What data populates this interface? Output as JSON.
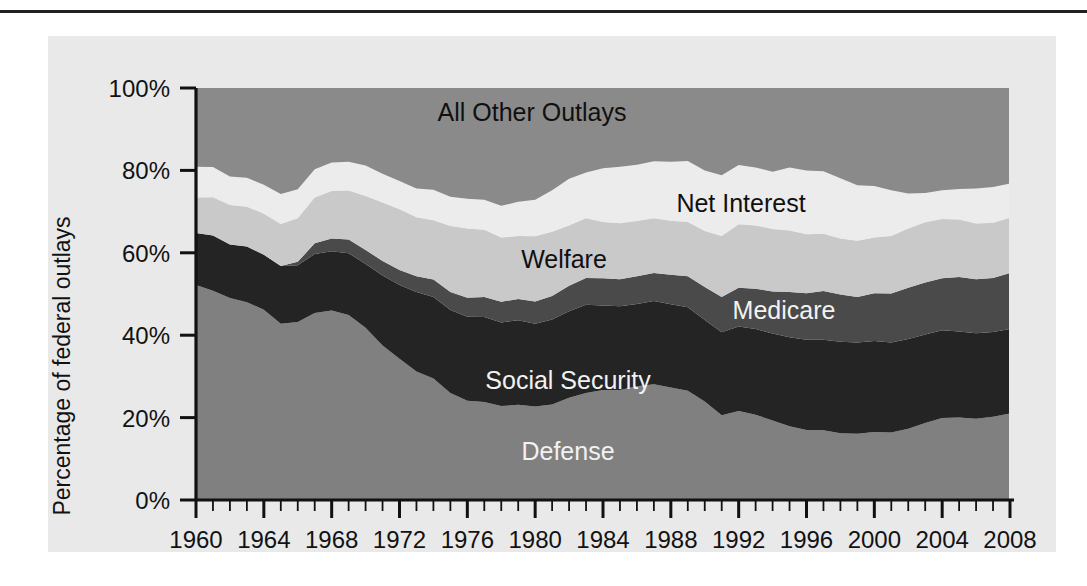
{
  "figure": {
    "panel_color": "#e9e9e9",
    "background_color": "#ffffff",
    "top_rule_color": "#222222"
  },
  "axis": {
    "y_title": "Percentage of federal outlays",
    "y_ticks": [
      "0%",
      "20%",
      "40%",
      "60%",
      "80%",
      "100%"
    ],
    "x_ticks": [
      "1960",
      "1964",
      "1968",
      "1972",
      "1976",
      "1980",
      "1984",
      "1988",
      "1992",
      "1996",
      "2000",
      "2004",
      "2008"
    ]
  },
  "series_labels": {
    "all_other_outlays": "All Other Outlays",
    "net_interest": "Net Interest",
    "welfare": "Welfare",
    "medicare": "Medicare",
    "social_security": "Social Security",
    "defense": "Defense"
  },
  "chart_data": {
    "type": "area",
    "title": "",
    "subtitle": "",
    "xlabel": "",
    "ylabel": "Percentage of federal outlays",
    "xlim": [
      1960,
      2008
    ],
    "ylim": [
      0,
      100
    ],
    "ytick_values": [
      0,
      20,
      40,
      60,
      80,
      100
    ],
    "ytick_labels": [
      "0%",
      "20%",
      "40%",
      "60%",
      "80%",
      "100%"
    ],
    "xtick_values": [
      1960,
      1964,
      1968,
      1972,
      1976,
      1980,
      1984,
      1988,
      1992,
      1996,
      2000,
      2004,
      2008
    ],
    "xtick_labels": [
      "1960",
      "1964",
      "1968",
      "1972",
      "1976",
      "1980",
      "1984",
      "1988",
      "1992",
      "1996",
      "2000",
      "2004",
      "2008"
    ],
    "minor_xtick_interval": 1,
    "grid": false,
    "legend_position": "inline-annotations",
    "stacked": true,
    "stack_order_bottom_to_top": [
      "Defense",
      "Social Security",
      "Medicare",
      "Welfare",
      "Net Interest",
      "All Other Outlays"
    ],
    "x": [
      1960,
      1961,
      1962,
      1963,
      1964,
      1965,
      1966,
      1967,
      1968,
      1969,
      1970,
      1971,
      1972,
      1973,
      1974,
      1975,
      1976,
      1977,
      1978,
      1979,
      1980,
      1981,
      1982,
      1983,
      1984,
      1985,
      1986,
      1987,
      1988,
      1989,
      1990,
      1991,
      1992,
      1993,
      1994,
      1995,
      1996,
      1997,
      1998,
      1999,
      2000,
      2001,
      2002,
      2003,
      2004,
      2005,
      2006,
      2007,
      2008
    ],
    "series": [
      {
        "name": "Defense",
        "color": "#808080",
        "values": [
          52.2,
          50.8,
          49.0,
          48.0,
          46.2,
          42.8,
          43.2,
          45.4,
          46.0,
          44.9,
          41.8,
          37.5,
          34.3,
          31.2,
          29.5,
          26.0,
          24.1,
          23.8,
          22.8,
          23.1,
          22.7,
          23.2,
          24.8,
          26.0,
          26.7,
          26.7,
          27.6,
          28.1,
          27.3,
          26.5,
          23.9,
          20.6,
          21.6,
          20.7,
          19.3,
          17.9,
          17.0,
          16.9,
          16.2,
          16.1,
          16.5,
          16.4,
          17.3,
          18.7,
          19.9,
          20.0,
          19.7,
          20.2,
          21.0
        ]
      },
      {
        "name": "Social Security",
        "color": "#242424",
        "values": [
          12.6,
          13.4,
          13.0,
          13.5,
          13.3,
          14.0,
          13.8,
          14.3,
          14.4,
          15.0,
          15.5,
          17.0,
          17.9,
          19.3,
          19.8,
          20.1,
          20.4,
          20.6,
          20.3,
          20.5,
          20.1,
          20.6,
          21.0,
          21.4,
          20.5,
          20.3,
          20.0,
          20.2,
          20.2,
          20.3,
          19.8,
          20.1,
          20.5,
          20.8,
          21.1,
          21.6,
          21.9,
          22.0,
          22.2,
          22.1,
          22.1,
          21.8,
          21.8,
          21.5,
          21.3,
          20.9,
          20.8,
          20.6,
          20.5
        ]
      },
      {
        "name": "Medicare",
        "color": "#4a4a4a",
        "values": [
          0.0,
          0.0,
          0.0,
          0.0,
          0.0,
          0.0,
          0.8,
          2.6,
          3.1,
          3.3,
          3.4,
          3.5,
          3.6,
          3.8,
          4.2,
          4.4,
          4.6,
          4.9,
          5.0,
          5.2,
          5.4,
          5.7,
          6.2,
          6.5,
          6.6,
          6.6,
          6.7,
          6.8,
          7.2,
          7.5,
          8.0,
          8.6,
          9.4,
          9.8,
          10.2,
          11.0,
          11.3,
          11.8,
          11.5,
          11.1,
          11.6,
          11.9,
          12.4,
          12.6,
          12.6,
          13.2,
          13.1,
          13.1,
          13.6
        ]
      },
      {
        "name": "Welfare",
        "color": "#c9c9c9",
        "values": [
          8.6,
          9.3,
          9.6,
          9.7,
          10.0,
          10.2,
          10.6,
          11.1,
          11.5,
          11.9,
          13.1,
          14.2,
          14.8,
          14.3,
          14.4,
          16.0,
          16.8,
          16.3,
          15.6,
          15.3,
          15.8,
          15.6,
          14.6,
          14.5,
          13.7,
          13.6,
          13.4,
          13.3,
          13.1,
          13.2,
          13.6,
          14.8,
          15.4,
          15.3,
          15.2,
          14.9,
          14.3,
          13.9,
          13.6,
          13.6,
          13.5,
          14.0,
          14.4,
          14.6,
          14.4,
          14.0,
          13.5,
          13.4,
          13.4
        ]
      },
      {
        "name": "Net Interest",
        "color": "#ececec",
        "values": [
          7.5,
          7.3,
          6.9,
          7.0,
          7.0,
          7.3,
          7.0,
          6.9,
          6.9,
          7.0,
          7.4,
          7.0,
          6.8,
          7.0,
          7.4,
          7.1,
          7.2,
          7.3,
          7.7,
          8.3,
          8.9,
          10.1,
          11.4,
          11.1,
          13.0,
          13.7,
          13.7,
          13.8,
          14.3,
          14.8,
          14.7,
          14.7,
          14.4,
          14.1,
          13.9,
          15.3,
          15.5,
          15.2,
          14.6,
          13.5,
          12.5,
          11.1,
          8.5,
          7.1,
          7.0,
          7.4,
          8.5,
          8.7,
          8.3
        ]
      },
      {
        "name": "All Other Outlays",
        "color": "#8a8a8a",
        "values": [
          19.1,
          19.2,
          21.5,
          21.8,
          23.5,
          25.7,
          24.6,
          19.7,
          18.1,
          17.9,
          18.8,
          20.8,
          22.6,
          24.4,
          24.7,
          26.4,
          26.9,
          27.1,
          28.6,
          27.6,
          27.1,
          24.8,
          22.0,
          20.5,
          19.5,
          19.1,
          18.6,
          17.8,
          17.9,
          17.7,
          20.0,
          21.2,
          18.7,
          19.3,
          20.3,
          19.3,
          20.0,
          20.2,
          21.9,
          23.6,
          23.8,
          24.8,
          25.6,
          25.5,
          24.8,
          24.5,
          24.4,
          24.0,
          23.2
        ]
      }
    ]
  }
}
